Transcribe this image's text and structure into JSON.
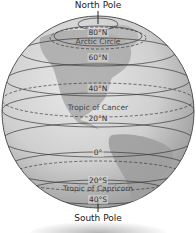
{
  "diagram": {
    "poles": {
      "north": "North Pole",
      "south": "South Pole"
    },
    "latitudes": [
      {
        "id": "80n",
        "label": "80°N",
        "y": 38
      },
      {
        "id": "arctic",
        "label": "Arctic Circle",
        "y": 45
      },
      {
        "id": "60n",
        "label": "60°N",
        "y": 57
      },
      {
        "id": "40n",
        "label": "40°N",
        "y": 88
      },
      {
        "id": "tropic-cancer",
        "label": "Tropic of Cancer",
        "y": 108
      },
      {
        "id": "20n",
        "label": "20°N",
        "y": 118
      },
      {
        "id": "0",
        "label": "0°",
        "y": 152
      },
      {
        "id": "20s",
        "label": "20°S",
        "y": 180
      },
      {
        "id": "tropic-capricorn",
        "label": "Tropic of Capricorn",
        "y": 188
      },
      {
        "id": "40s",
        "label": "40°S",
        "y": 199
      }
    ],
    "colors": {
      "ocean": "#cfcfcf",
      "land": "#a9a9a9",
      "lines": "#3a3a3a",
      "rim": "#555555"
    }
  }
}
